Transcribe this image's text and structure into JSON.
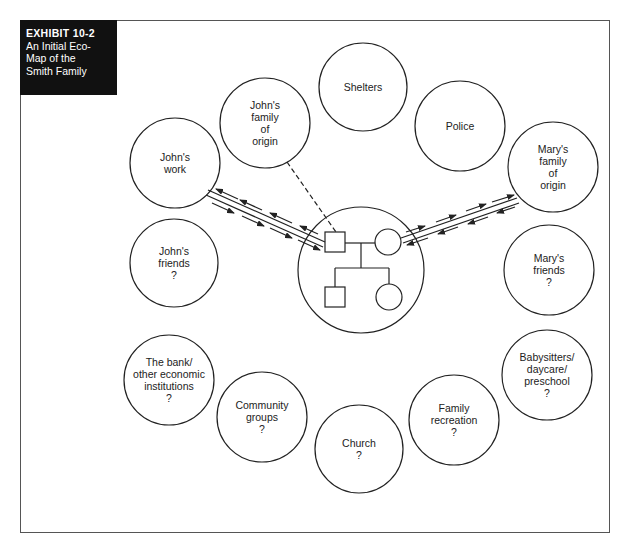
{
  "exhibit": {
    "number": "EXHIBIT 10-2",
    "title_lines": [
      "An Initial Eco-",
      "Map of the",
      "Smith Family"
    ]
  },
  "colors": {
    "line": "#222222",
    "box_bg": "#111111",
    "box_text": "#ffffff",
    "frame": "#555555"
  },
  "family": {
    "members": [
      {
        "name": "John",
        "symbol": "square"
      },
      {
        "name": "Mary",
        "symbol": "circle"
      },
      {
        "name": "Son",
        "symbol": "square"
      },
      {
        "name": "Daughter",
        "symbol": "circle"
      }
    ]
  },
  "systems": [
    {
      "id": "shelters",
      "lines": [
        "Shelters"
      ],
      "cx": 363,
      "cy": 87,
      "r": 44
    },
    {
      "id": "johns-family-of-origin",
      "lines": [
        "John's",
        "family",
        "of",
        "origin"
      ],
      "cx": 265,
      "cy": 123,
      "r": 45
    },
    {
      "id": "police",
      "lines": [
        "Police"
      ],
      "cx": 460,
      "cy": 126,
      "r": 45
    },
    {
      "id": "johns-work",
      "lines": [
        "John's",
        "work"
      ],
      "cx": 175,
      "cy": 163,
      "r": 45
    },
    {
      "id": "marys-family-of-origin",
      "lines": [
        "Mary's",
        "family",
        "of",
        "origin"
      ],
      "cx": 553,
      "cy": 167,
      "r": 45
    },
    {
      "id": "johns-friends",
      "lines": [
        "John's",
        "friends",
        "?"
      ],
      "cx": 174,
      "cy": 263,
      "r": 44
    },
    {
      "id": "marys-friends",
      "lines": [
        "Mary's",
        "friends",
        "?"
      ],
      "cx": 549,
      "cy": 270,
      "r": 45
    },
    {
      "id": "bank",
      "lines": [
        "The bank/",
        "other economic",
        "institutions",
        "?"
      ],
      "cx": 169,
      "cy": 380,
      "r": 45
    },
    {
      "id": "babysitters",
      "lines": [
        "Babysitters/",
        "daycare/",
        "preschool",
        "?"
      ],
      "cx": 547,
      "cy": 375,
      "r": 45
    },
    {
      "id": "community-groups",
      "lines": [
        "Community",
        "groups",
        "?"
      ],
      "cx": 262,
      "cy": 417,
      "r": 45
    },
    {
      "id": "family-recreation",
      "lines": [
        "Family",
        "recreation",
        "?"
      ],
      "cx": 454,
      "cy": 420,
      "r": 45
    },
    {
      "id": "church",
      "lines": [
        "Church",
        "?"
      ],
      "cx": 359,
      "cy": 449,
      "r": 44
    }
  ],
  "connections": [
    {
      "from": "johns-family-of-origin",
      "to": "John",
      "type": "tenuous (dashed)"
    },
    {
      "from": "johns-work",
      "to": "John",
      "type": "strong, two-way energy flow"
    },
    {
      "from": "marys-family-of-origin",
      "to": "Mary",
      "type": "strong, two-way energy flow"
    }
  ]
}
